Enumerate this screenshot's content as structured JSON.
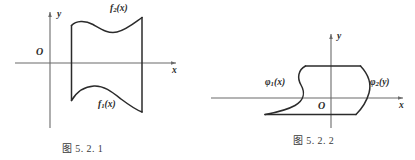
{
  "page": {
    "background_color": "#ffffff",
    "ink_color": "#2b2b2b",
    "axis_color": "#6b6b6b"
  },
  "figures": [
    {
      "id": "figure-5-2-1",
      "caption": "图 5. 2. 1",
      "axes": {
        "x_label": "x",
        "y_label": "y",
        "origin_label": "O"
      },
      "curve_labels": {
        "upper_name": "f",
        "upper_sub": "2",
        "upper_arg": "(x)",
        "upper_full": "f2(x)",
        "lower_name": "f",
        "lower_sub": "1",
        "lower_arg": "(x)",
        "lower_full": "f1(x)"
      },
      "region_description": "Region bounded above by f2(x) and below by f1(x), between two vertical lines"
    },
    {
      "id": "figure-5-2-2",
      "caption": "图 5. 2. 2",
      "axes": {
        "x_label": "x",
        "y_label": "y",
        "origin_label": "O"
      },
      "curve_labels": {
        "left_name": "φ",
        "left_sub": "1",
        "left_arg": "(x)",
        "left_full": "φ1(x)",
        "right_name": "φ",
        "right_sub": "2",
        "right_arg": "(y)",
        "right_full": "φ2(y)"
      },
      "region_description": "Region bounded left by φ1(x) and right by φ2(y), between two horizontal lines"
    }
  ]
}
